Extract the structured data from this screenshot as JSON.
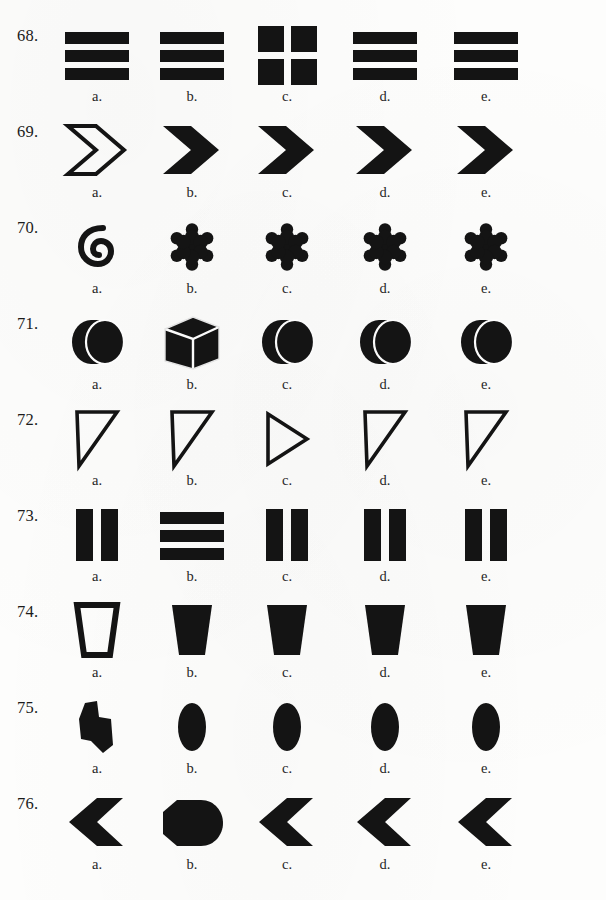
{
  "page": {
    "ink_color": "#141414",
    "paper_color": "#fdfdfc",
    "option_letters": [
      "a.",
      "b.",
      "c.",
      "d.",
      "e."
    ],
    "column_centers": [
      97,
      192,
      287,
      385,
      486
    ],
    "row_tops": [
      20,
      116,
      212,
      308,
      404,
      500,
      596,
      692,
      788
    ]
  },
  "questions": [
    {
      "number": "68.",
      "top": 20,
      "options": [
        {
          "letter": "a.",
          "shape": "three-horizontal-bars",
          "fill": "solid",
          "note": "three stacked horizontal bars"
        },
        {
          "letter": "b.",
          "shape": "three-horizontal-bars",
          "fill": "solid",
          "note": "three stacked horizontal bars"
        },
        {
          "letter": "c.",
          "shape": "four-squares-grid",
          "fill": "solid",
          "note": "two by two grid of squares (odd one out)"
        },
        {
          "letter": "d.",
          "shape": "three-horizontal-bars",
          "fill": "solid",
          "note": "three stacked horizontal bars"
        },
        {
          "letter": "e.",
          "shape": "three-horizontal-bars",
          "fill": "solid",
          "note": "three stacked horizontal bars"
        }
      ]
    },
    {
      "number": "69.",
      "top": 116,
      "options": [
        {
          "letter": "a.",
          "shape": "chevron-right",
          "fill": "outline",
          "note": "outlined right chevron (odd one out)"
        },
        {
          "letter": "b.",
          "shape": "chevron-right",
          "fill": "solid",
          "note": "solid right chevron"
        },
        {
          "letter": "c.",
          "shape": "chevron-right",
          "fill": "solid",
          "note": "solid right chevron"
        },
        {
          "letter": "d.",
          "shape": "chevron-right",
          "fill": "solid",
          "note": "solid right chevron"
        },
        {
          "letter": "e.",
          "shape": "chevron-right",
          "fill": "solid",
          "note": "solid right chevron"
        }
      ]
    },
    {
      "number": "70.",
      "top": 212,
      "options": [
        {
          "letter": "a.",
          "shape": "spiral",
          "fill": "solid",
          "note": "curled spiral hook (odd one out)"
        },
        {
          "letter": "b.",
          "shape": "six-lobe-star",
          "fill": "solid",
          "note": "six lobed star burst"
        },
        {
          "letter": "c.",
          "shape": "six-lobe-star",
          "fill": "solid",
          "note": "six lobed star burst"
        },
        {
          "letter": "d.",
          "shape": "six-lobe-star",
          "fill": "solid",
          "note": "six lobed star burst"
        },
        {
          "letter": "e.",
          "shape": "six-lobe-star",
          "fill": "solid",
          "note": "six lobed star burst"
        }
      ]
    },
    {
      "number": "71.",
      "top": 308,
      "options": [
        {
          "letter": "a.",
          "shape": "cylinder-disc",
          "fill": "solid",
          "note": "disc seen at an angle"
        },
        {
          "letter": "b.",
          "shape": "cube-3d",
          "fill": "solid",
          "note": "three dimensional cube (odd one out)"
        },
        {
          "letter": "c.",
          "shape": "cylinder-disc",
          "fill": "solid",
          "note": "disc seen at an angle"
        },
        {
          "letter": "d.",
          "shape": "cylinder-disc",
          "fill": "solid",
          "note": "disc seen at an angle"
        },
        {
          "letter": "e.",
          "shape": "cylinder-disc",
          "fill": "solid",
          "note": "disc seen at an angle"
        }
      ]
    },
    {
      "number": "72.",
      "top": 404,
      "options": [
        {
          "letter": "a.",
          "shape": "triangle-down-left",
          "fill": "outline",
          "note": "right triangle pointing down"
        },
        {
          "letter": "b.",
          "shape": "triangle-down-left",
          "fill": "outline",
          "note": "right triangle pointing down"
        },
        {
          "letter": "c.",
          "shape": "triangle-right",
          "fill": "outline",
          "note": "triangle pointing right (odd one out)"
        },
        {
          "letter": "d.",
          "shape": "triangle-down-left",
          "fill": "outline",
          "note": "right triangle pointing down"
        },
        {
          "letter": "e.",
          "shape": "triangle-down-left",
          "fill": "outline",
          "note": "right triangle pointing down"
        }
      ]
    },
    {
      "number": "73.",
      "top": 500,
      "options": [
        {
          "letter": "a.",
          "shape": "two-vertical-bars",
          "fill": "solid",
          "note": "two vertical bars"
        },
        {
          "letter": "b.",
          "shape": "three-horizontal-bars",
          "fill": "solid",
          "note": "three horizontal bars (odd one out)"
        },
        {
          "letter": "c.",
          "shape": "two-vertical-bars",
          "fill": "solid",
          "note": "two vertical bars"
        },
        {
          "letter": "d.",
          "shape": "two-vertical-bars",
          "fill": "solid",
          "note": "two vertical bars"
        },
        {
          "letter": "e.",
          "shape": "two-vertical-bars",
          "fill": "solid",
          "note": "two vertical bars"
        }
      ]
    },
    {
      "number": "74.",
      "top": 596,
      "options": [
        {
          "letter": "a.",
          "shape": "trapezoid",
          "fill": "outline",
          "note": "outlined trapezoid cup (odd one out)"
        },
        {
          "letter": "b.",
          "shape": "trapezoid",
          "fill": "solid",
          "note": "solid trapezoid cup"
        },
        {
          "letter": "c.",
          "shape": "trapezoid",
          "fill": "solid",
          "note": "solid trapezoid cup"
        },
        {
          "letter": "d.",
          "shape": "trapezoid",
          "fill": "solid",
          "note": "solid trapezoid cup"
        },
        {
          "letter": "e.",
          "shape": "trapezoid",
          "fill": "solid",
          "note": "solid trapezoid cup"
        }
      ]
    },
    {
      "number": "75.",
      "top": 692,
      "options": [
        {
          "letter": "a.",
          "shape": "zigzag-polygon",
          "fill": "solid",
          "note": "irregular stepped polygon (odd one out)"
        },
        {
          "letter": "b.",
          "shape": "ellipse",
          "fill": "solid",
          "note": "vertical filled ellipse"
        },
        {
          "letter": "c.",
          "shape": "ellipse",
          "fill": "solid",
          "note": "vertical filled ellipse"
        },
        {
          "letter": "d.",
          "shape": "ellipse",
          "fill": "solid",
          "note": "vertical filled ellipse"
        },
        {
          "letter": "e.",
          "shape": "ellipse",
          "fill": "solid",
          "note": "vertical filled ellipse"
        }
      ]
    },
    {
      "number": "76.",
      "top": 788,
      "options": [
        {
          "letter": "a.",
          "shape": "chevron-left",
          "fill": "solid",
          "note": "solid left chevron"
        },
        {
          "letter": "b.",
          "shape": "rounded-blob",
          "fill": "solid",
          "note": "filled rounded blob (odd one out)"
        },
        {
          "letter": "c.",
          "shape": "chevron-left",
          "fill": "solid",
          "note": "solid left chevron"
        },
        {
          "letter": "d.",
          "shape": "chevron-left",
          "fill": "solid",
          "note": "solid left chevron"
        },
        {
          "letter": "e.",
          "shape": "chevron-left",
          "fill": "solid",
          "note": "solid left chevron"
        }
      ]
    }
  ]
}
